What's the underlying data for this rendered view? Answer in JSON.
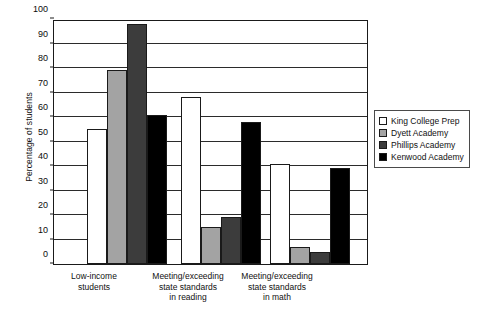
{
  "chart_data": {
    "type": "bar",
    "title": "",
    "xlabel": "",
    "ylabel": "Percentage of students",
    "ylim": [
      0,
      100
    ],
    "ytick_step": 10,
    "yticks": [
      0,
      10,
      20,
      30,
      40,
      50,
      60,
      70,
      80,
      90,
      100
    ],
    "grid": true,
    "legend_position": "right",
    "categories": [
      "Low-income students",
      "Meeting/exceeding state standards in reading",
      "Meeting/exceeding state standards in math"
    ],
    "category_lines": [
      [
        "Low-income",
        "students"
      ],
      [
        "Meeting/exceeding",
        "state standards",
        "in reading"
      ],
      [
        "Meeting/exceeding",
        "state standards",
        "in math"
      ]
    ],
    "series": [
      {
        "name": "King College Prep",
        "color": "#ffffff",
        "swatch": "sw-white",
        "values": [
          55,
          68,
          41
        ]
      },
      {
        "name": "Dyett Academy",
        "color": "#a3a3a3",
        "swatch": "sw-lgray",
        "values": [
          79,
          15,
          7
        ]
      },
      {
        "name": "Phillips Academy",
        "color": "#3c3c3c",
        "swatch": "sw-dgray",
        "values": [
          98,
          19,
          5
        ]
      },
      {
        "name": "Kenwood Academy",
        "color": "#000000",
        "swatch": "sw-black",
        "values": [
          61,
          58,
          39
        ]
      }
    ]
  }
}
